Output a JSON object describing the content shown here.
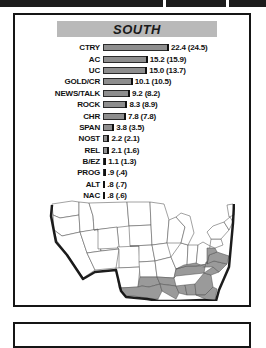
{
  "panel": {
    "title": "SOUTH"
  },
  "chart_data": {
    "type": "bar",
    "title": "SOUTH",
    "xlabel": "",
    "ylabel": "",
    "xlim": [
      0,
      22.4
    ],
    "grid": false,
    "legend": "none",
    "value_format": "current (previous)",
    "categories": [
      "CTRY",
      "AC",
      "UC",
      "GOLD/CR",
      "NEWS/TALK",
      "ROCK",
      "CHR",
      "SPAN",
      "NOST",
      "REL",
      "B/EZ",
      "PROG",
      "ALT",
      "NAC",
      "CLAS",
      "MISC"
    ],
    "values": [
      22.4,
      15.2,
      15.0,
      10.1,
      9.2,
      8.3,
      7.8,
      3.8,
      2.2,
      2.1,
      1.1,
      0.9,
      0.8,
      0.8,
      0.5,
      0.1
    ],
    "previous_values": [
      24.5,
      15.9,
      13.7,
      10.5,
      8.2,
      8.9,
      7.8,
      3.5,
      2.1,
      1.6,
      1.3,
      0.4,
      0.7,
      0.6,
      0.2,
      0.0
    ],
    "series": [
      {
        "name": "current",
        "values": [
          22.4,
          15.2,
          15.0,
          10.1,
          9.2,
          8.3,
          7.8,
          3.8,
          2.2,
          2.1,
          1.1,
          0.9,
          0.8,
          0.8,
          0.5,
          0.1
        ]
      },
      {
        "name": "previous",
        "values": [
          24.5,
          15.9,
          13.7,
          10.5,
          8.2,
          8.9,
          7.8,
          3.5,
          2.1,
          1.6,
          1.3,
          0.4,
          0.7,
          0.6,
          0.2,
          0.0
        ]
      }
    ],
    "rows": [
      {
        "label": "CTRY",
        "value": 22.4,
        "value_text": "22.4 (24.5)"
      },
      {
        "label": "AC",
        "value": 15.2,
        "value_text": "15.2 (15.9)"
      },
      {
        "label": "UC",
        "value": 15.0,
        "value_text": "15.0 (13.7)"
      },
      {
        "label": "GOLD/CR",
        "value": 10.1,
        "value_text": "10.1 (10.5)"
      },
      {
        "label": "NEWS/TALK",
        "value": 9.2,
        "value_text": "9.2 (8.2)"
      },
      {
        "label": "ROCK",
        "value": 8.3,
        "value_text": "8.3 (8.9)"
      },
      {
        "label": "CHR",
        "value": 7.8,
        "value_text": "7.8 (7.8)"
      },
      {
        "label": "SPAN",
        "value": 3.8,
        "value_text": "3.8 (3.5)"
      },
      {
        "label": "NOST",
        "value": 2.2,
        "value_text": "2.2 (2.1)"
      },
      {
        "label": "REL",
        "value": 2.1,
        "value_text": "2.1 (1.6)"
      },
      {
        "label": "B/EZ",
        "value": 1.1,
        "value_text": "1.1 (1.3)"
      },
      {
        "label": "PROG",
        "value": 0.9,
        "value_text": ".9 (.4)"
      },
      {
        "label": "ALT",
        "value": 0.8,
        "value_text": ".8 (.7)"
      },
      {
        "label": "NAC",
        "value": 0.8,
        "value_text": ".8 (.6)"
      },
      {
        "label": "CLAS",
        "value": 0.5,
        "value_text": ".5 (.2)"
      },
      {
        "label": "MISC",
        "value": 0.1,
        "value_text": ".1 (.0)"
      }
    ]
  },
  "map": {
    "name": "united-states-map",
    "highlight_color": "#9a9a9a",
    "base_color": "#ffffff",
    "outline_color": "#4a4a4a",
    "highlighted_region": "South"
  }
}
